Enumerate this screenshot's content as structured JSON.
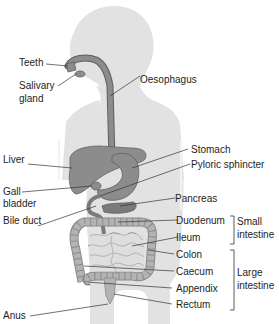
{
  "colors": {
    "body_silhouette": "#e2e2e2",
    "organ_fill": "#8c8c8c",
    "organ_dark": "#6e6e6e",
    "intestine_fill": "#b3b3b3",
    "leader_line": "#333333",
    "text": "#1e1e1e"
  },
  "labels_left": {
    "teeth": "Teeth",
    "salivary_gland_1": "Salivary",
    "salivary_gland_2": "gland",
    "liver": "Liver",
    "gall_bladder_1": "Gall",
    "gall_bladder_2": "bladder",
    "bile_duct": "Bile duct",
    "anus": "Anus"
  },
  "labels_right": {
    "oesophagus": "Oesophagus",
    "stomach": "Stomach",
    "pyloric_sphincter": "Pyloric sphincter",
    "pancreas": "Pancreas",
    "duodenum": "Duodenum",
    "ileum": "Ileum",
    "colon": "Colon",
    "caecum": "Caecum",
    "appendix": "Appendix",
    "rectum": "Rectum"
  },
  "groups": {
    "small_intestine_1": "Small",
    "small_intestine_2": "intestine",
    "large_intestine_1": "Large",
    "large_intestine_2": "intestine"
  }
}
